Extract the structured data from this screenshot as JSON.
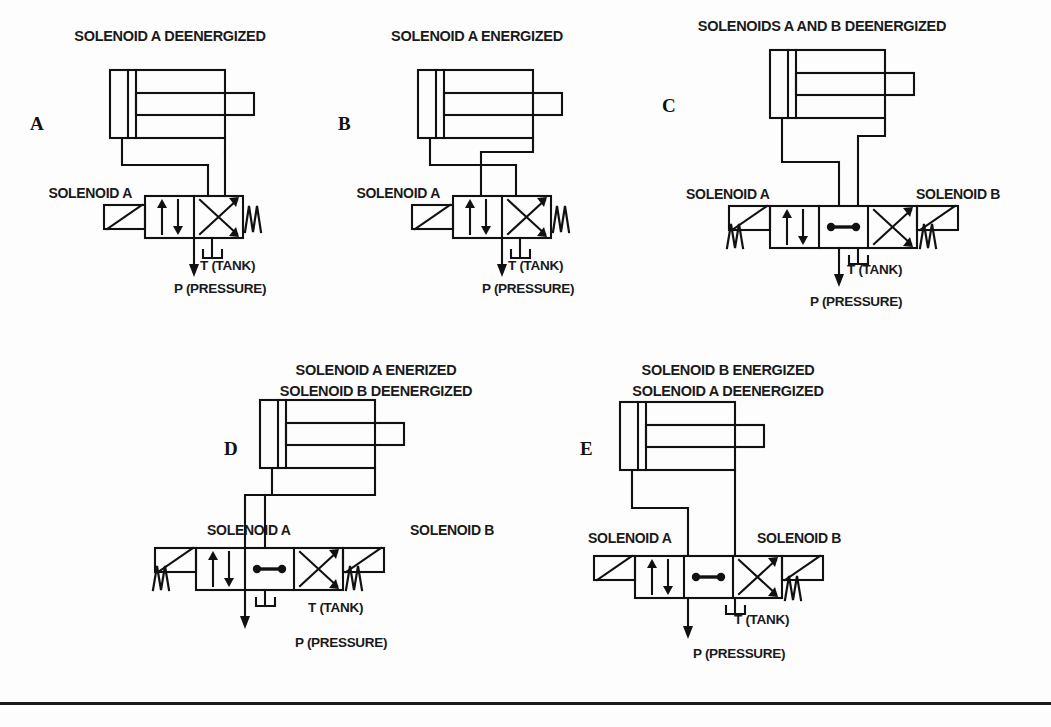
{
  "figure": {
    "type": "hydraulic-schematic-plate",
    "background_color": "#fdfdfd",
    "ink_color": "#111111",
    "bottom_rule": true
  },
  "panels": [
    {
      "id": "A",
      "index_label": "A",
      "title_lines": [
        "SOLENOID A DEENERGIZED"
      ],
      "valve": {
        "positions": 2,
        "actuator_left": "solenoid",
        "actuator_right": "spring",
        "solenoid_left_label": "SOLENOID A",
        "solenoid_right_label": null,
        "active_box": "crossed",
        "boxes": [
          "parallel",
          "crossed"
        ]
      },
      "cylinder": {
        "piston": "retracted",
        "rod_side": "right"
      },
      "port_labels": {
        "tank": "T (TANK)",
        "pressure": "P (PRESSURE)"
      }
    },
    {
      "id": "B",
      "index_label": "B",
      "title_lines": [
        "SOLENOID A ENERGIZED"
      ],
      "valve": {
        "positions": 2,
        "actuator_left": "solenoid",
        "actuator_right": "spring",
        "solenoid_left_label": "SOLENOID A",
        "solenoid_right_label": null,
        "active_box": "parallel",
        "boxes": [
          "parallel",
          "crossed"
        ]
      },
      "cylinder": {
        "piston": "retracted",
        "rod_side": "right"
      },
      "port_labels": {
        "tank": "T (TANK)",
        "pressure": "P (PRESSURE)"
      }
    },
    {
      "id": "C",
      "index_label": "C",
      "title_lines": [
        "SOLENOIDS A AND B DEENERGIZED"
      ],
      "valve": {
        "positions": 3,
        "actuator_left": "solenoid-spring",
        "actuator_right": "solenoid-spring",
        "solenoid_left_label": "SOLENOID A",
        "solenoid_right_label": "SOLENOID B",
        "active_box": "closed-center",
        "boxes": [
          "parallel",
          "closed-center",
          "crossed"
        ]
      },
      "cylinder": {
        "piston": "retracted",
        "rod_side": "right"
      },
      "port_labels": {
        "tank": "T (TANK)",
        "pressure": "P (PRESSURE)"
      }
    },
    {
      "id": "D",
      "index_label": "D",
      "title_lines": [
        "SOLENOID A ENERIZED",
        "SOLENOID B DEENERGIZED"
      ],
      "valve": {
        "positions": 3,
        "actuator_left": "solenoid-spring",
        "actuator_right": "solenoid-spring",
        "solenoid_left_label": "SOLENOID A",
        "solenoid_right_label": "SOLENOID B",
        "active_box": "parallel",
        "boxes": [
          "parallel",
          "closed-center",
          "crossed"
        ]
      },
      "cylinder": {
        "piston": "retracted",
        "rod_side": "right"
      },
      "port_labels": {
        "tank": "T (TANK)",
        "pressure": "P (PRESSURE)"
      }
    },
    {
      "id": "E",
      "index_label": "E",
      "title_lines": [
        "SOLENOID B ENERGIZED",
        "SOLENOID A DEENERGIZED"
      ],
      "valve": {
        "positions": 3,
        "actuator_left": "solenoid-spring",
        "actuator_right": "solenoid-spring",
        "solenoid_left_label": "SOLENOID A",
        "solenoid_right_label": "SOLENOID B",
        "active_box": "crossed",
        "boxes": [
          "parallel",
          "closed-center",
          "crossed"
        ]
      },
      "cylinder": {
        "piston": "retracted",
        "rod_side": "right"
      },
      "port_labels": {
        "tank": "T (TANK)",
        "pressure": "P (PRESSURE)"
      }
    }
  ]
}
